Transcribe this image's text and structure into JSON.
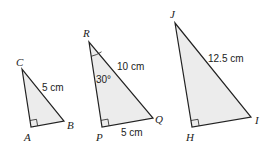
{
  "figure": {
    "triangles": [
      {
        "id": "ABC",
        "vertices": {
          "C": "C",
          "A": "A",
          "B": "B"
        },
        "right_angle_at": "A",
        "labels": {
          "hypotenuse": "5 cm"
        }
      },
      {
        "id": "PQR",
        "vertices": {
          "R": "R",
          "P": "P",
          "Q": "Q"
        },
        "right_angle_at": "P",
        "labels": {
          "hypotenuse": "10 cm",
          "base": "5 cm",
          "angle_R": "30°"
        }
      },
      {
        "id": "HIJ",
        "vertices": {
          "J": "J",
          "H": "H",
          "I": "I"
        },
        "right_angle_at": "H",
        "labels": {
          "hypotenuse": "12.5 cm"
        }
      }
    ]
  },
  "colors": {
    "fill": "#ececec",
    "stroke": "#222222"
  }
}
